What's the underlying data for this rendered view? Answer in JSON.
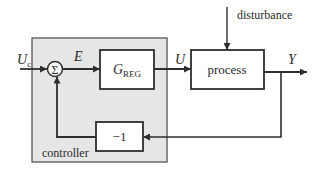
{
  "diagram": {
    "type": "block-diagram",
    "title": "",
    "colors": {
      "line": "#3a3a3a",
      "controller_fill": "#e6e6e6",
      "block_fill": "#ffffff",
      "background": "#ffffff"
    },
    "signals": {
      "reference": "U",
      "reference_sub": "c",
      "error": "E",
      "control": "U",
      "output": "Y",
      "disturbance": "disturbance"
    },
    "blocks": {
      "sum": {
        "symbol": "Σ"
      },
      "regulator": {
        "main": "G",
        "sub": "REG"
      },
      "process": {
        "label": "process"
      },
      "negation": {
        "label": "−1"
      },
      "controller_group": {
        "label": "controller"
      }
    }
  }
}
